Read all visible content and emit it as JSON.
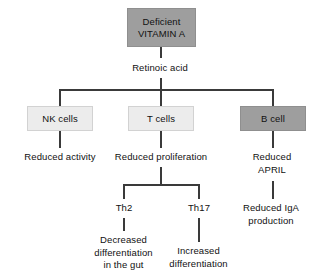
{
  "diagram": {
    "colors": {
      "box_dark_fill": "#9e9e9e",
      "box_light_fill": "#ececec",
      "line": "#3a3a3a",
      "text": "#111111",
      "background": "#ffffff"
    },
    "root": {
      "label": "Deficient\nVITAMIN A",
      "style": "dark"
    },
    "mediator": {
      "label": "Retinoic acid"
    },
    "branches": [
      {
        "id": "nk",
        "box_label": "NK cells",
        "box_style": "light",
        "outcome": "Reduced activity"
      },
      {
        "id": "t",
        "box_label": "T cells",
        "box_style": "light",
        "outcome": "Reduced proliferation",
        "subbranches": [
          {
            "id": "th2",
            "label": "Th2",
            "outcome": "Decreased\ndifferentiation\nin the gut"
          },
          {
            "id": "th17",
            "label": "Th17",
            "outcome": "Increased\ndifferentiation"
          }
        ]
      },
      {
        "id": "b",
        "box_label": "B cell",
        "box_style": "dark",
        "outcome": "Reduced\nAPRIL",
        "downstream": "Reduced IgA\nproduction"
      }
    ]
  }
}
